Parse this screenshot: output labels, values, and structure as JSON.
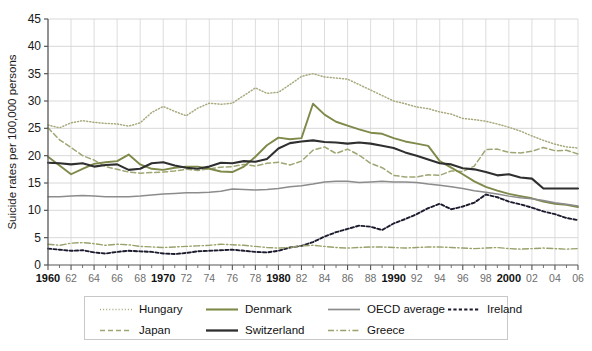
{
  "chart_data": {
    "type": "line",
    "title": "",
    "xlabel": "",
    "ylabel": "Suicide rates per 100,000 persons",
    "xlim": [
      1960,
      2006
    ],
    "ylim": [
      0,
      45
    ],
    "yticks": [
      0,
      5,
      10,
      15,
      20,
      25,
      30,
      35,
      40,
      45
    ],
    "grid": true,
    "legend_position": "bottom",
    "x": [
      1960,
      1961,
      1962,
      1963,
      1964,
      1965,
      1966,
      1967,
      1968,
      1969,
      1970,
      1971,
      1972,
      1973,
      1974,
      1975,
      1976,
      1977,
      1978,
      1979,
      1980,
      1981,
      1982,
      1983,
      1984,
      1985,
      1986,
      1987,
      1988,
      1989,
      1990,
      1991,
      1992,
      1993,
      1994,
      1995,
      1996,
      1997,
      1998,
      1999,
      2000,
      2001,
      2002,
      2003,
      2004,
      2005,
      2006
    ],
    "xtick_labels": [
      "1960",
      "62",
      "64",
      "66",
      "68",
      "1970",
      "72",
      "74",
      "76",
      "78",
      "1980",
      "82",
      "84",
      "86",
      "88",
      "1990",
      "92",
      "94",
      "96",
      "98",
      "2000",
      "02",
      "04",
      "06"
    ],
    "xtick_major": [
      "1960",
      "1970",
      "1980",
      "1990",
      "2000"
    ],
    "series": [
      {
        "name": "Hungary",
        "color": "#a9a97e",
        "style": "dotted",
        "values": [
          25.6,
          25.1,
          26.0,
          26.4,
          26.1,
          25.9,
          25.8,
          25.4,
          26.0,
          27.9,
          29.0,
          28.1,
          27.3,
          28.7,
          29.6,
          29.4,
          29.6,
          31.0,
          32.4,
          31.4,
          31.6,
          33.0,
          34.5,
          35.0,
          34.4,
          34.2,
          34.0,
          33.0,
          32.0,
          31.0,
          30.0,
          29.5,
          28.9,
          28.6,
          28.0,
          27.6,
          26.8,
          26.6,
          26.3,
          25.8,
          25.2,
          24.5,
          23.6,
          22.8,
          22.1,
          21.6,
          21.4
        ],
        "note": "estimated from plot; peak ~35 in mid-1980s"
      },
      {
        "name": "Japan",
        "color": "#a0a673",
        "style": "dashed",
        "values": [
          25.1,
          22.9,
          21.5,
          20.0,
          19.2,
          18.0,
          17.5,
          17.0,
          16.8,
          16.9,
          17.0,
          17.2,
          17.5,
          17.3,
          17.6,
          17.9,
          18.0,
          18.4,
          18.1,
          18.6,
          18.8,
          18.3,
          19.0,
          21.0,
          21.6,
          20.4,
          21.2,
          20.1,
          18.6,
          17.8,
          16.4,
          16.1,
          16.1,
          16.5,
          16.4,
          17.2,
          17.1,
          18.1,
          21.1,
          21.2,
          20.6,
          20.5,
          20.8,
          21.5,
          20.9,
          21.0,
          20.3
        ],
        "note": "1998 jump to about 21"
      },
      {
        "name": "Denmark",
        "color": "#7d8a49",
        "style": "solid",
        "values": [
          19.8,
          18.2,
          16.6,
          17.6,
          18.5,
          18.8,
          19.0,
          20.2,
          18.4,
          17.6,
          17.4,
          17.8,
          18.0,
          18.0,
          17.6,
          17.1,
          17.0,
          18.0,
          19.8,
          21.9,
          23.3,
          23.0,
          23.2,
          29.5,
          27.5,
          26.2,
          25.5,
          24.8,
          24.2,
          24.0,
          23.2,
          22.6,
          22.2,
          21.8,
          19.0,
          17.8,
          16.6,
          15.3,
          14.3,
          13.6,
          13.0,
          12.6,
          12.2,
          11.6,
          11.2,
          11.0,
          10.6
        ],
        "note": "sharp peak about 29.5 near 1980-81"
      },
      {
        "name": "Switzerland",
        "color": "#2f2f2f",
        "style": "solid",
        "values": [
          18.7,
          18.6,
          18.4,
          18.6,
          18.0,
          18.3,
          18.4,
          17.4,
          17.6,
          18.6,
          18.8,
          18.2,
          17.8,
          17.6,
          18.0,
          18.7,
          18.6,
          19.0,
          18.9,
          19.4,
          21.3,
          22.3,
          22.6,
          22.8,
          22.5,
          22.4,
          22.2,
          22.4,
          22.2,
          21.8,
          21.4,
          20.6,
          20.0,
          19.3,
          18.6,
          18.4,
          17.7,
          17.5,
          17.0,
          16.4,
          16.6,
          16.0,
          15.8,
          14.0,
          14.0,
          14.0,
          14.0
        ],
        "note": "flat at about 14 after 2003"
      },
      {
        "name": "OECD average",
        "color": "#8c8c8c",
        "style": "solid",
        "values": [
          12.5,
          12.5,
          12.6,
          12.7,
          12.6,
          12.5,
          12.5,
          12.5,
          12.6,
          12.8,
          13.0,
          13.1,
          13.2,
          13.2,
          13.3,
          13.5,
          13.9,
          13.8,
          13.7,
          13.8,
          14.0,
          14.3,
          14.5,
          14.8,
          15.2,
          15.3,
          15.3,
          15.1,
          15.2,
          15.3,
          15.2,
          15.2,
          15.1,
          14.8,
          14.6,
          14.3,
          14.0,
          13.6,
          13.3,
          13.0,
          12.6,
          12.3,
          12.1,
          11.8,
          11.4,
          11.1,
          10.8
        ],
        "note": "gentle hump peaking near 15.3 in mid-1980s"
      },
      {
        "name": "Ireland",
        "color": "#1b1b2e",
        "style": "dashed-dense",
        "values": [
          3.0,
          2.8,
          2.6,
          2.7,
          2.3,
          2.1,
          2.4,
          2.6,
          2.5,
          2.4,
          2.1,
          2.0,
          2.2,
          2.5,
          2.6,
          2.7,
          2.8,
          2.6,
          2.4,
          2.3,
          2.6,
          3.2,
          3.5,
          4.2,
          5.2,
          6.0,
          6.6,
          7.2,
          7.0,
          6.4,
          7.6,
          8.4,
          9.3,
          10.4,
          11.2,
          10.2,
          10.7,
          11.4,
          12.9,
          12.4,
          11.6,
          11.1,
          10.5,
          9.8,
          9.3,
          8.6,
          8.2
        ],
        "note": "rises steadily; peak near 13 about 1998"
      },
      {
        "name": "Greece",
        "color": "#9aa16a",
        "style": "dash-dot",
        "values": [
          3.8,
          3.6,
          4.0,
          4.1,
          3.9,
          3.6,
          3.8,
          3.7,
          3.4,
          3.3,
          3.2,
          3.3,
          3.4,
          3.5,
          3.6,
          3.8,
          3.7,
          3.6,
          3.4,
          3.2,
          3.1,
          3.2,
          3.5,
          3.6,
          3.4,
          3.2,
          3.1,
          3.2,
          3.3,
          3.3,
          3.2,
          3.1,
          3.2,
          3.3,
          3.3,
          3.2,
          3.1,
          3.0,
          3.1,
          3.2,
          3.0,
          2.9,
          3.0,
          3.1,
          3.0,
          2.9,
          3.0
        ],
        "note": "flat near 3 throughout"
      }
    ]
  },
  "legend": {
    "row1": [
      {
        "label": "Hungary",
        "series": "Hungary"
      },
      {
        "label": "Denmark",
        "series": "Denmark"
      },
      {
        "label": "OECD average",
        "series": "OECD average"
      },
      {
        "label": "Ireland",
        "series": "Ireland"
      }
    ],
    "row2": [
      {
        "label": "Japan",
        "series": "Japan"
      },
      {
        "label": "Switzerland",
        "series": "Switzerland"
      },
      {
        "label": "Greece",
        "series": "Greece"
      }
    ]
  },
  "colors": {
    "background": "#ffffff",
    "grid": "#d4d4d4",
    "axis": "#555555",
    "tick_text": "#6e6e6e",
    "tick_text_major": "#111111"
  }
}
